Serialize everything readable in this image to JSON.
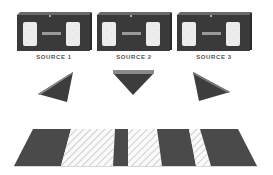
{
  "diagram": {
    "sources": [
      {
        "label": "SOURCE 1"
      },
      {
        "label": "SOURCE 2"
      },
      {
        "label": "SOURCE 3"
      }
    ],
    "prisms": [
      {
        "name": "left-prism"
      },
      {
        "name": "center-prism"
      },
      {
        "name": "right-prism"
      }
    ],
    "floor_bands": [
      "dark",
      "hatched",
      "dark",
      "hatched",
      "dark",
      "hatched",
      "dark"
    ],
    "colors": {
      "box": "#3a3a3a",
      "box_top": "#6a6a6a",
      "window": "#e8e8e8",
      "prism": "#3d3d3d",
      "prism_edge": "#8a8a8a",
      "band_dark": "#4a4a4a",
      "hatch": "#9a9a9a",
      "label": "#555555"
    }
  }
}
